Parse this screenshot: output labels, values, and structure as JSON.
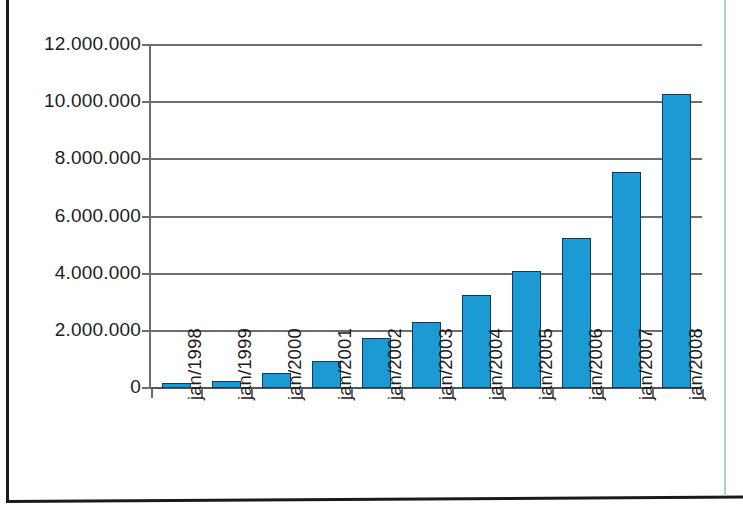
{
  "chart_data": {
    "type": "bar",
    "title": "",
    "subtitle": "",
    "xlabel": "",
    "ylabel": "",
    "categories": [
      "jan/1998",
      "jan/1999",
      "jan/2000",
      "jan/2001",
      "jan/2002",
      "jan/2003",
      "jan/2004",
      "jan/2005",
      "jan/2006",
      "jan/2007",
      "jan/2008"
    ],
    "values": [
      170000,
      250000,
      510000,
      960000,
      1750000,
      2320000,
      3250000,
      4100000,
      5250000,
      7550000,
      10300000
    ],
    "series": [
      {
        "name": "",
        "values": [
          170000,
          250000,
          510000,
          960000,
          1750000,
          2320000,
          3250000,
          4100000,
          5250000,
          7550000,
          10300000
        ]
      }
    ],
    "ylim": [
      0,
      12000000
    ],
    "ytick_values": [
      0,
      2000000,
      4000000,
      6000000,
      8000000,
      10000000,
      12000000
    ],
    "ytick_labels": [
      "0",
      "2.000.000",
      "4.000.000",
      "6.000.000",
      "8.000.000",
      "10.000.000",
      "12.000.000"
    ],
    "grid": true,
    "grid_axis": "y",
    "legend": false,
    "legend_position": "none",
    "bar_color": "#1b9ad4",
    "bar_edge_color": "#123a5e",
    "axis_color": "#6e6e6e",
    "background_color": "#ffffff",
    "xtick_rotation": 90,
    "annotations": []
  }
}
